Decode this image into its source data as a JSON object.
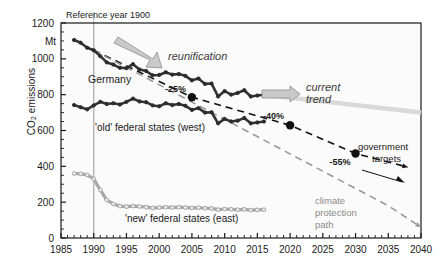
{
  "chart_data": {
    "type": "line",
    "title": "",
    "xlabel": "",
    "ylabel": "CO2 emissions",
    "ylabel_prefix": "CO",
    "ylabel_sub": "2",
    "ylabel_suffix": " emissions",
    "yunit": "Mt",
    "xlim": [
      1985,
      2040
    ],
    "ylim": [
      0,
      1200
    ],
    "xticks": [
      1985,
      1990,
      1995,
      2000,
      2005,
      2010,
      2015,
      2020,
      2025,
      2030,
      2035,
      2040
    ],
    "xticklabels": [
      "1985",
      "1990",
      "1995",
      "2000",
      "2005",
      "2010",
      "2015",
      "2020",
      "2025",
      "2030",
      "2035",
      "2040"
    ],
    "yticks": [
      0,
      200,
      400,
      600,
      800,
      1000,
      1200
    ],
    "yticklabels": [
      "0",
      "200",
      "400",
      "600",
      "800",
      "1000",
      "1200"
    ],
    "xminor_step": 1,
    "yminor_step": 50,
    "grid": false,
    "reference_line": {
      "x": 1990,
      "label": "Reference year 1900",
      "color": "#b4b4b4"
    },
    "series": [
      {
        "name": "Germany",
        "style": "solid-thick-dark-markers",
        "color": "#333333",
        "label": "Germany",
        "x": [
          1987,
          1988,
          1989,
          1990,
          1991,
          1992,
          1993,
          1994,
          1995,
          1996,
          1997,
          1998,
          1999,
          2000,
          2001,
          2002,
          2003,
          2004,
          2005,
          2006,
          2007,
          2008,
          2009,
          2010,
          2011,
          2012,
          2013,
          2014,
          2015,
          2016
        ],
        "y": [
          1105,
          1090,
          1062,
          1048,
          1015,
          980,
          968,
          950,
          948,
          970,
          940,
          932,
          908,
          910,
          925,
          912,
          915,
          905,
          880,
          890,
          860,
          862,
          790,
          820,
          800,
          810,
          825,
          790,
          795,
          800
        ]
      },
      {
        "name": "'old' federal states (west)",
        "style": "solid-thick-dark-markers",
        "color": "#333333",
        "label": "'old' federal states (west)",
        "x": [
          1987,
          1988,
          1989,
          1990,
          1991,
          1992,
          1993,
          1994,
          1995,
          1996,
          1997,
          1998,
          1999,
          2000,
          2001,
          2002,
          2003,
          2004,
          2005,
          2006,
          2007,
          2008,
          2009,
          2010,
          2011,
          2012,
          2013,
          2014,
          2015,
          2016
        ],
        "y": [
          742,
          730,
          718,
          740,
          760,
          748,
          752,
          745,
          760,
          778,
          762,
          758,
          740,
          735,
          752,
          742,
          748,
          738,
          715,
          725,
          700,
          702,
          640,
          665,
          650,
          655,
          670,
          640,
          645,
          650
        ]
      },
      {
        "name": "'new' federal states (east)",
        "style": "solid-thick-light-markers",
        "color": "#a8a8a8",
        "label": "'new' federal states (east)",
        "x": [
          1987,
          1988,
          1989,
          1990,
          1991,
          1992,
          1993,
          1994,
          1995,
          1996,
          1997,
          1998,
          1999,
          2000,
          2001,
          2002,
          2003,
          2004,
          2005,
          2006,
          2007,
          2008,
          2009,
          2010,
          2011,
          2012,
          2013,
          2014,
          2015,
          2016
        ],
        "y": [
          360,
          358,
          352,
          330,
          268,
          212,
          190,
          178,
          175,
          178,
          176,
          172,
          168,
          170,
          172,
          170,
          172,
          170,
          168,
          170,
          166,
          165,
          158,
          162,
          160,
          158,
          160,
          156,
          157,
          158
        ]
      }
    ],
    "trend_lines": [
      {
        "name": "government targets",
        "style": "dashed-black",
        "color": "#111111",
        "label": "government targets",
        "points": [
          [
            1990,
            1048
          ],
          [
            2005,
            786
          ],
          [
            2020,
            629
          ],
          [
            2030,
            472
          ],
          [
            2038,
            395
          ]
        ],
        "arrow_at": [
          2038,
          395
        ]
      },
      {
        "name": "climate protection path",
        "style": "dashed-grey",
        "color": "#9a9a9a",
        "label": "climate protection path",
        "points": [
          [
            1990,
            1048
          ],
          [
            2035,
            180
          ],
          [
            2040,
            60
          ]
        ],
        "arrow_at": [
          2036,
          150
        ]
      },
      {
        "name": "current trend",
        "style": "solid-light-grey-thick",
        "color": "#d9d9d9",
        "label": "current trend",
        "points": [
          [
            2016,
            800
          ],
          [
            2040,
            700
          ]
        ]
      }
    ],
    "markers": [
      {
        "label": "-25%",
        "x": 2005,
        "y": 786,
        "color": "#111111"
      },
      {
        "label": "-40%",
        "x": 2020,
        "y": 629,
        "color": "#111111"
      },
      {
        "label": "-55%",
        "x": 2030,
        "y": 472,
        "color": "#111111"
      }
    ],
    "annotations": [
      {
        "name": "reunification",
        "text": "reunification",
        "style": "italic-grey-arrow"
      },
      {
        "name": "current-trend",
        "text": "current",
        "text2": "trend",
        "style": "italic-grey-arrow"
      },
      {
        "name": "government-targets",
        "text": "government",
        "text2": "targets",
        "style": "plain-dark"
      },
      {
        "name": "climate-protection-path",
        "text": "climate",
        "text2": "protection",
        "text3": "path",
        "style": "plain-grey"
      }
    ],
    "colors": {
      "axis": "#1a1a1a",
      "dark_series": "#333333",
      "light_series": "#a8a8a8",
      "trend_grey": "#d9d9d9",
      "ref_line": "#b4b4b4",
      "climate_grey": "#9a9a9a",
      "plot_bg": "#fbfbfb"
    }
  }
}
